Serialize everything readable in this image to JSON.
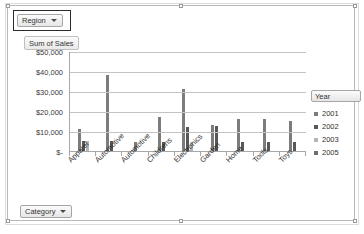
{
  "pivot": {
    "row_field_button": {
      "label": "Region",
      "icon": "chevron-down-icon"
    },
    "column_field_button": {
      "label": "Category",
      "icon": "chevron-down-icon"
    },
    "value_field_label": "Sum of Sales",
    "legend_field_button": {
      "label": "Year",
      "icon": "chevron-down-icon"
    }
  },
  "chart_data": {
    "type": "bar",
    "title": "Sum of Sales",
    "xlabel": "",
    "ylabel": "Sum of Sales",
    "ylim": [
      0,
      50000
    ],
    "grid": true,
    "legend_position": "right",
    "ytick_labels": [
      "$50,000",
      "$40,000",
      "$30,000",
      "$20,000",
      "$10,000",
      "$-"
    ],
    "ytick_values": [
      50000,
      40000,
      30000,
      20000,
      10000,
      0
    ],
    "categories": [
      "Apparel",
      "Automotive",
      "Automotive",
      "Childrens",
      "Electronics",
      "Garden",
      "Home",
      "Tools",
      "Toys"
    ],
    "series": [
      {
        "name": "2001",
        "color": "#7c7c7c",
        "values": [
          11000,
          0,
          0,
          0,
          0,
          0,
          0,
          0,
          0
        ]
      },
      {
        "name": "2002",
        "color": "#585858",
        "values": [
          5000,
          5000,
          38000,
          0,
          17000,
          13000,
          16000,
          16000,
          15000
        ]
      },
      {
        "name": "2003",
        "color": "#b5b5b5",
        "values": [
          0,
          0,
          4500,
          4500,
          4500,
          12000,
          4500,
          4500,
          4500
        ]
      },
      {
        "name": "2005",
        "color": "#6f6f6f",
        "values": [
          0,
          0,
          0,
          0,
          31000,
          0,
          0,
          0,
          0
        ]
      }
    ],
    "bar_groups": [
      {
        "category": "Apparel",
        "bars": [
          11000,
          5000,
          5000
        ]
      },
      {
        "category": "Automotive",
        "bars": [
          38000,
          5000
        ]
      },
      {
        "category": "Automotive",
        "bars": [
          4500
        ]
      },
      {
        "category": "Childrens",
        "bars": [
          17000,
          4500
        ]
      },
      {
        "category": "Electronics",
        "bars": [
          31000,
          12000,
          4500
        ]
      },
      {
        "category": "Garden",
        "bars": [
          13000,
          12500
        ]
      },
      {
        "category": "Home",
        "bars": [
          16000,
          4500
        ]
      },
      {
        "category": "Tools",
        "bars": [
          16000,
          4500
        ]
      },
      {
        "category": "Toys",
        "bars": [
          15000,
          4500
        ]
      }
    ],
    "legend_entries": [
      {
        "label": "2001",
        "color": "#7c7c7c"
      },
      {
        "label": "2002",
        "color": "#585858"
      },
      {
        "label": "2003",
        "color": "#b5b5b5"
      },
      {
        "label": "2005",
        "color": "#6f6f6f"
      }
    ]
  }
}
